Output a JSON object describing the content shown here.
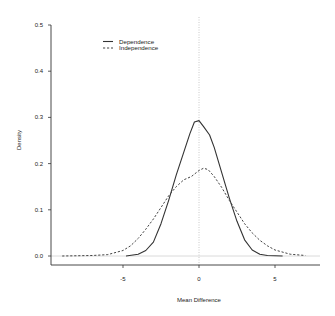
{
  "chart_data": {
    "type": "line",
    "title": "",
    "xlabel": "Mean Difference",
    "ylabel": "Density",
    "xlim": [
      -9.8,
      8.0
    ],
    "ylim": [
      0.0,
      0.5
    ],
    "x_ticks": [
      -5,
      0,
      5
    ],
    "x_tick_labels": [
      "-5",
      "0",
      "5"
    ],
    "y_ticks": [
      0.0,
      0.1,
      0.2,
      0.3,
      0.4,
      0.5
    ],
    "y_tick_labels": [
      "0.0",
      "0.1",
      "0.2",
      "0.3",
      "0.4",
      "0.5"
    ],
    "grid": false,
    "legend_position": "top-left",
    "reference_lines": [
      {
        "orientation": "vertical",
        "value": 0,
        "style": "dotted",
        "color": "#bbbbbb"
      },
      {
        "orientation": "horizontal",
        "value": 0,
        "style": "solid",
        "color": "#cccccc"
      }
    ],
    "series": [
      {
        "name": "Dependence",
        "line_style": "solid",
        "color": "#333333",
        "x": [
          -4.8,
          -4.0,
          -3.5,
          -3.0,
          -2.5,
          -2.0,
          -1.5,
          -1.0,
          -0.6,
          -0.3,
          0.0,
          0.3,
          0.7,
          1.0,
          1.5,
          2.0,
          2.5,
          3.0,
          3.5,
          4.0,
          4.5,
          5.5
        ],
        "values": [
          0.0,
          0.004,
          0.012,
          0.03,
          0.07,
          0.12,
          0.175,
          0.225,
          0.265,
          0.29,
          0.293,
          0.28,
          0.262,
          0.235,
          0.18,
          0.125,
          0.075,
          0.035,
          0.013,
          0.004,
          0.001,
          0.0
        ]
      },
      {
        "name": "Independence",
        "line_style": "dashed",
        "color": "#444444",
        "x": [
          -9.0,
          -7.0,
          -6.0,
          -5.0,
          -4.5,
          -4.0,
          -3.5,
          -3.0,
          -2.5,
          -2.0,
          -1.5,
          -1.5,
          -1.0,
          -0.5,
          0.0,
          0.3,
          0.6,
          1.0,
          1.5,
          2.0,
          2.5,
          3.0,
          3.5,
          4.0,
          4.5,
          5.0,
          6.0,
          7.0
        ],
        "values": [
          0.0,
          0.001,
          0.003,
          0.012,
          0.022,
          0.038,
          0.058,
          0.08,
          0.105,
          0.13,
          0.15,
          0.15,
          0.165,
          0.172,
          0.185,
          0.19,
          0.187,
          0.172,
          0.148,
          0.12,
          0.095,
          0.07,
          0.05,
          0.034,
          0.022,
          0.013,
          0.004,
          0.001
        ]
      }
    ]
  },
  "legend": {
    "items": [
      {
        "label": "Dependence",
        "style": "solid"
      },
      {
        "label": "Independence",
        "style": "dashed"
      }
    ]
  }
}
